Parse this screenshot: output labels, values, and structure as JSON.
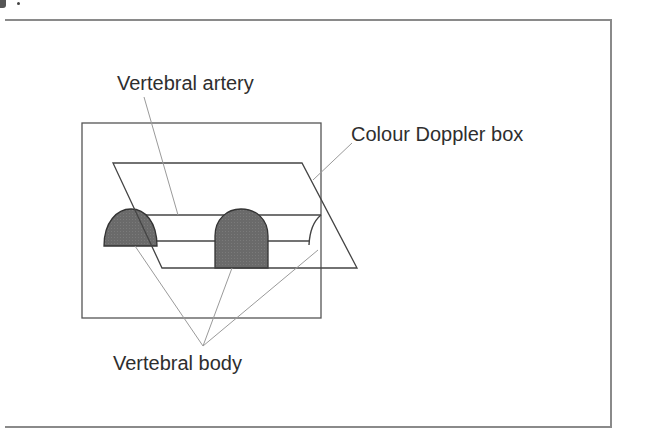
{
  "figure": {
    "labels": {
      "vertebral_artery": "Vertebral artery",
      "colour_doppler_box": "Colour Doppler box",
      "vertebral_body": "Vertebral body"
    },
    "colors": {
      "frame": "#8a8a8a",
      "line": "#555555",
      "leader": "#9a9a9a",
      "vertebra_fill": "#6b6b6b",
      "text": "#2e2e2e"
    }
  }
}
